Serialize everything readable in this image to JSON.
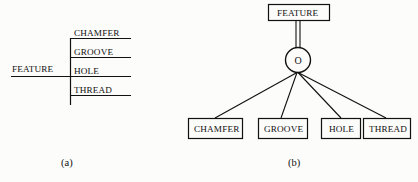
{
  "figure": {
    "background_color": "#fcfcfb",
    "line_color": "#111111",
    "panels": [
      {
        "id": "panel-a",
        "caption": "(a)",
        "style": "bracket-tree",
        "root_label": "FEATURE",
        "children": [
          "CHAMFER",
          "GROOVE",
          "HOLE",
          "THREAD"
        ]
      },
      {
        "id": "panel-b",
        "caption": "(b)",
        "style": "generalization-circle",
        "root_label": "FEATURE",
        "circle_label": "O",
        "children": [
          "CHAMFER",
          "GROOVE",
          "HOLE",
          "THREAD"
        ]
      }
    ]
  },
  "panel_a": {
    "caption": "(a)",
    "root": "FEATURE",
    "items": [
      {
        "label": "CHAMFER"
      },
      {
        "label": "GROOVE"
      },
      {
        "label": "HOLE"
      },
      {
        "label": "THREAD"
      }
    ]
  },
  "panel_b": {
    "caption": "(b)",
    "root": "FEATURE",
    "circle": "O",
    "items": [
      {
        "label": "CHAMFER"
      },
      {
        "label": "GROOVE"
      },
      {
        "label": "HOLE"
      },
      {
        "label": "THREAD"
      }
    ]
  }
}
